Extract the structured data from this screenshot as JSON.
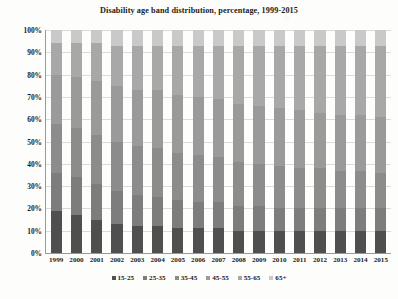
{
  "chart_data": {
    "type": "bar",
    "subtype": "stacked-bar-100-percent",
    "title": "Disability age band distribution, percentage, 1999-2015",
    "xlabel": "",
    "ylabel": "",
    "ylim": [
      0,
      100
    ],
    "ytick_labels": [
      "0%",
      "10%",
      "20%",
      "30%",
      "40%",
      "50%",
      "60%",
      "70%",
      "80%",
      "90%",
      "100%"
    ],
    "ytick_values": [
      0,
      10,
      20,
      30,
      40,
      50,
      60,
      70,
      80,
      90,
      100
    ],
    "grid": true,
    "legend_position": "bottom",
    "categories": [
      "1999",
      "2000",
      "2001",
      "2002",
      "2003",
      "2004",
      "2005",
      "2006",
      "2007",
      "2008",
      "2009",
      "2010",
      "2011",
      "2012",
      "2013",
      "2014",
      "2015"
    ],
    "series": [
      {
        "name": "15-25",
        "color": "#4f4f4f",
        "values": [
          19,
          17,
          15,
          13,
          12,
          12,
          11,
          11,
          11,
          10,
          10,
          10,
          10,
          10,
          10,
          10,
          10
        ]
      },
      {
        "name": "25-35",
        "color": "#7d7d7d",
        "values": [
          17,
          17,
          16,
          15,
          14,
          13,
          13,
          12,
          12,
          11,
          11,
          10,
          10,
          10,
          10,
          10,
          10
        ]
      },
      {
        "name": "35-45",
        "color": "#8c8c8c",
        "values": [
          22,
          22,
          22,
          22,
          22,
          22,
          21,
          21,
          20,
          20,
          19,
          19,
          18,
          18,
          17,
          17,
          16
        ]
      },
      {
        "name": "45-55",
        "color": "#9a9a9a",
        "values": [
          22,
          23,
          24,
          25,
          25,
          26,
          26,
          26,
          26,
          26,
          26,
          26,
          26,
          25,
          25,
          25,
          25
        ]
      },
      {
        "name": "55-65",
        "color": "#a8a8a8",
        "values": [
          14,
          15,
          17,
          18,
          20,
          20,
          22,
          23,
          24,
          26,
          27,
          28,
          29,
          30,
          31,
          31,
          32
        ]
      },
      {
        "name": "65+",
        "color": "#c9c9c9",
        "values": [
          6,
          6,
          6,
          7,
          7,
          7,
          7,
          7,
          7,
          7,
          7,
          7,
          7,
          7,
          7,
          7,
          7
        ]
      }
    ]
  }
}
